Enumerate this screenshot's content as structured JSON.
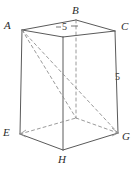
{
  "figure": {
    "shape": "rectangular-prism",
    "stroke_color": "#5a5a5a",
    "dashed_color": "#8c8c8c",
    "background_color": "#ffffff",
    "label_color": "#2b2b2b",
    "vertices": [
      {
        "id": "A",
        "label": "A",
        "x": 22,
        "y": 30,
        "hidden": false,
        "label_x": 4,
        "label_y": 20
      },
      {
        "id": "B",
        "label": "B",
        "x": 76,
        "y": 20,
        "hidden": false,
        "label_x": 72,
        "label_y": 5
      },
      {
        "id": "C",
        "label": "C",
        "x": 115,
        "y": 31,
        "hidden": false,
        "label_x": 121,
        "label_y": 21
      },
      {
        "id": "D",
        "label": "",
        "x": 63,
        "y": 37,
        "hidden": false,
        "label_x": 0,
        "label_y": 0
      },
      {
        "id": "E",
        "label": "E",
        "x": 20,
        "y": 134,
        "hidden": false,
        "label_x": 3,
        "label_y": 127
      },
      {
        "id": "F",
        "label": "",
        "x": 76,
        "y": 118,
        "hidden": true,
        "label_x": 0,
        "label_y": 0
      },
      {
        "id": "G",
        "label": "G",
        "x": 118,
        "y": 133,
        "hidden": false,
        "label_x": 122,
        "label_y": 131
      },
      {
        "id": "H",
        "label": "H",
        "x": 63,
        "y": 150,
        "hidden": false,
        "label_x": 58,
        "label_y": 154
      }
    ],
    "solid_edges": [
      {
        "from": "A",
        "to": "B",
        "name": "edge-AB"
      },
      {
        "from": "B",
        "to": "C",
        "name": "edge-BC"
      },
      {
        "from": "A",
        "to": "D",
        "name": "edge-AD"
      },
      {
        "from": "D",
        "to": "C",
        "name": "edge-DC"
      },
      {
        "from": "A",
        "to": "E",
        "name": "edge-AE"
      },
      {
        "from": "D",
        "to": "H",
        "name": "edge-DH"
      },
      {
        "from": "C",
        "to": "G",
        "name": "edge-CG"
      },
      {
        "from": "E",
        "to": "H",
        "name": "edge-EH"
      },
      {
        "from": "H",
        "to": "G",
        "name": "edge-HG"
      }
    ],
    "dashed_edges": [
      {
        "from": "B",
        "to": "F",
        "name": "edge-BF"
      },
      {
        "from": "E",
        "to": "F",
        "name": "edge-EF"
      },
      {
        "from": "F",
        "to": "G",
        "name": "edge-FG"
      },
      {
        "from": "A",
        "to": "G",
        "name": "diagonal-AG"
      },
      {
        "from": "A",
        "to": "F",
        "name": "diagonal-AF"
      }
    ],
    "measurements": [
      {
        "id": "top-five",
        "value": "5",
        "edge": "AB",
        "x": 62,
        "y": 22
      },
      {
        "id": "right-five",
        "value": "5",
        "edge": "CG",
        "x": 115,
        "y": 72
      }
    ]
  }
}
